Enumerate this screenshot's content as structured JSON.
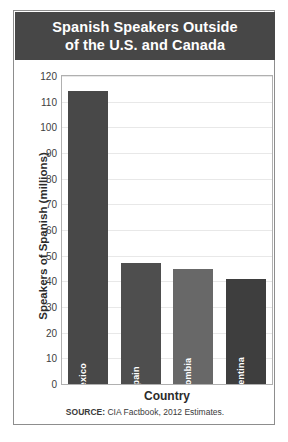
{
  "figure": {
    "title_line1": "Spanish Speakers Outside",
    "title_line2": "of the U.S. and Canada",
    "source_prefix": "SOURCE:",
    "source_text": " CIA Factbook, 2012 Estimates.",
    "title_band_color": "#474747",
    "frame_border_color": "#8d8d8d",
    "plot_border_color": "#b0b0b0",
    "gridline_color": "#e8e8e8"
  },
  "chart_data": {
    "type": "bar",
    "title": "Spanish Speakers Outside of the U.S. and Canada",
    "categories": [
      "Mexico",
      "Spain",
      "Colombia",
      "Argentina"
    ],
    "values": [
      114,
      47,
      45,
      41
    ],
    "bar_colors": [
      "#484848",
      "#4e4e4e",
      "#686868",
      "#3e3e3e"
    ],
    "xlabel": "Country",
    "ylabel": "Speakers of Spanish (millions)",
    "ylim": [
      0,
      120
    ],
    "ytick_step": 10,
    "yticks": [
      0,
      10,
      20,
      30,
      40,
      50,
      60,
      70,
      80,
      90,
      100,
      110,
      120
    ],
    "ytick_labels": [
      "0",
      "10",
      "20",
      "30",
      "40",
      "50",
      "60",
      "70",
      "80",
      "90",
      "100",
      "110",
      "120"
    ],
    "grid": true,
    "legend": null,
    "source": "SOURCE: CIA Factbook, 2012 Estimates."
  }
}
